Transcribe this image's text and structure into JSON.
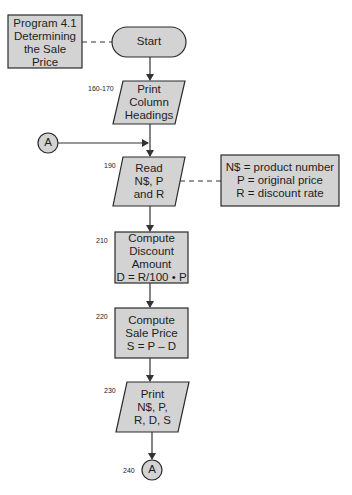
{
  "title_box": {
    "lines": [
      "Program 4.1",
      "Determining",
      "the Sale",
      "Price"
    ]
  },
  "nodes": [
    {
      "id": "start",
      "type": "terminal",
      "lines": [
        "Start"
      ]
    },
    {
      "id": "print-headings",
      "type": "io",
      "label": "160-170",
      "lines": [
        "Print",
        "Column",
        "Headings"
      ]
    },
    {
      "id": "read-input",
      "type": "io",
      "label": "190",
      "lines": [
        "Read",
        "N$, P",
        "and R"
      ]
    },
    {
      "id": "compute-discount",
      "type": "process",
      "label": "210",
      "lines": [
        "Compute",
        "Discount",
        "Amount",
        "D = R/100 • P"
      ]
    },
    {
      "id": "compute-sale",
      "type": "process",
      "label": "220",
      "lines": [
        "Compute",
        "Sale Price",
        "S = P – D"
      ]
    },
    {
      "id": "print-output",
      "type": "io",
      "label": "230",
      "lines": [
        "Print",
        "N$, P,",
        "R, D, S"
      ]
    },
    {
      "id": "connector-end",
      "type": "connector",
      "label": "240",
      "lines": [
        "A"
      ]
    }
  ],
  "connector_entry": {
    "lines": [
      "A"
    ]
  },
  "annotation": {
    "lines": [
      "N$ = product number",
      "P = original price",
      "R = discount rate"
    ]
  },
  "colors": {
    "fill": "#d3d3d3",
    "stroke": "#2a2a2a",
    "text": "#1e1e1e"
  }
}
